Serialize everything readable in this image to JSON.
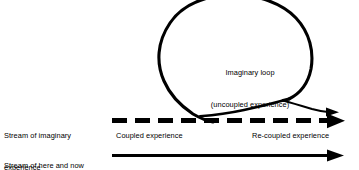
{
  "figure": {
    "background_color": "#ffffff",
    "ink_color": "#000000"
  },
  "labels": {
    "stream_imaginary_line1": "Stream of imaginary",
    "stream_imaginary_line2": "experience",
    "stream_here_now_line1": "Stream of here and now",
    "stream_here_now_line2": "experience",
    "loop_line1": "Imaginary loop",
    "loop_line2": "(uncoupled experience)",
    "coupled": "Coupled experience",
    "recoupled": "Re-coupled experience"
  },
  "elements": {
    "imaginary_loop": "imaginary-loop-curve",
    "dashed_stream_arrow": "dashed-arrow-imaginary-stream",
    "loop_tail_arrow": "thin-arrow-loop-tail",
    "solid_stream_arrow": "solid-arrow-here-and-now-stream"
  }
}
